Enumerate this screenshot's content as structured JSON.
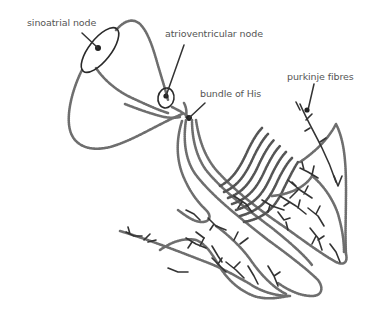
{
  "diagram": {
    "labels": {
      "sinoatrial_node": "sinoatrial node",
      "atrioventricular_node": "atrioventricular node",
      "bundle_of_his": "bundle of His",
      "purkinje_fibres": "purkinje fibres"
    },
    "colors": {
      "outline": "#6e6e6e",
      "ink": "#2a2a2a",
      "label_text": "#555555",
      "background": "#ffffff"
    }
  }
}
